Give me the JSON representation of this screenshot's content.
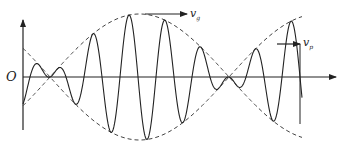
{
  "diagram": {
    "labels": {
      "origin": "O",
      "group_velocity": "v",
      "group_velocity_sub": "g",
      "phase_velocity": "v",
      "phase_velocity_sub": "p"
    },
    "colors": {
      "line": "#222222",
      "dash": "#444444",
      "background": "#ffffff"
    },
    "axes": {
      "origin": [
        23,
        77
      ],
      "x_end": 336,
      "y_top": 20,
      "y_bottom": 130
    },
    "envelope": {
      "amplitude": 63,
      "nodes_x": [
        50,
        229
      ],
      "x_start": 23,
      "x_end": 302
    },
    "carrier": {
      "wavelength": 36,
      "phase_peak_x": 129,
      "x_start": 23,
      "x_end": 302
    },
    "arrows": {
      "vg": {
        "from": [
          145,
          14
        ],
        "to": [
          187,
          14
        ]
      },
      "vp": {
        "from": [
          277,
          44
        ],
        "to": [
          300,
          44
        ],
        "drop_to_y": 124
      }
    }
  }
}
